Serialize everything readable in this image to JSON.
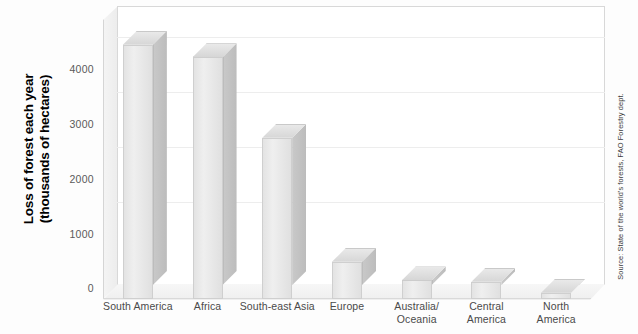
{
  "chart_data": {
    "type": "bar",
    "title": "",
    "xlabel": "",
    "ylabel": "Loss of forest each year (thousands of hectares)",
    "ylabel_lines": [
      "Loss of forest each year",
      "(thousands of hectares)"
    ],
    "categories": [
      "South America",
      "Africa",
      "South-east Asia",
      "Europe",
      "Australia/ Oceania",
      "Central America",
      "North America"
    ],
    "category_lines": [
      [
        "South America"
      ],
      [
        "Africa"
      ],
      [
        "South-east Asia"
      ],
      [
        "Europe"
      ],
      [
        "Australia/",
        "Oceania"
      ],
      [
        "Central",
        "America"
      ],
      [
        "North",
        "America"
      ]
    ],
    "values": [
      4100,
      3900,
      2600,
      600,
      300,
      280,
      100
    ],
    "ylim": [
      0,
      4500
    ],
    "yticks": [
      0,
      1000,
      2000,
      3000,
      4000
    ],
    "ytick_labels": [
      "0",
      "1000",
      "2000",
      "3000",
      "4000"
    ],
    "grid": true,
    "legend": "none",
    "style": "3d-column",
    "bar_color": "#e6e6e6",
    "annotation": "Source: State of the world's forests, FAO Forestry dept."
  },
  "source": {
    "text": "Source: State of the world's forests, FAO Forestry dept."
  }
}
